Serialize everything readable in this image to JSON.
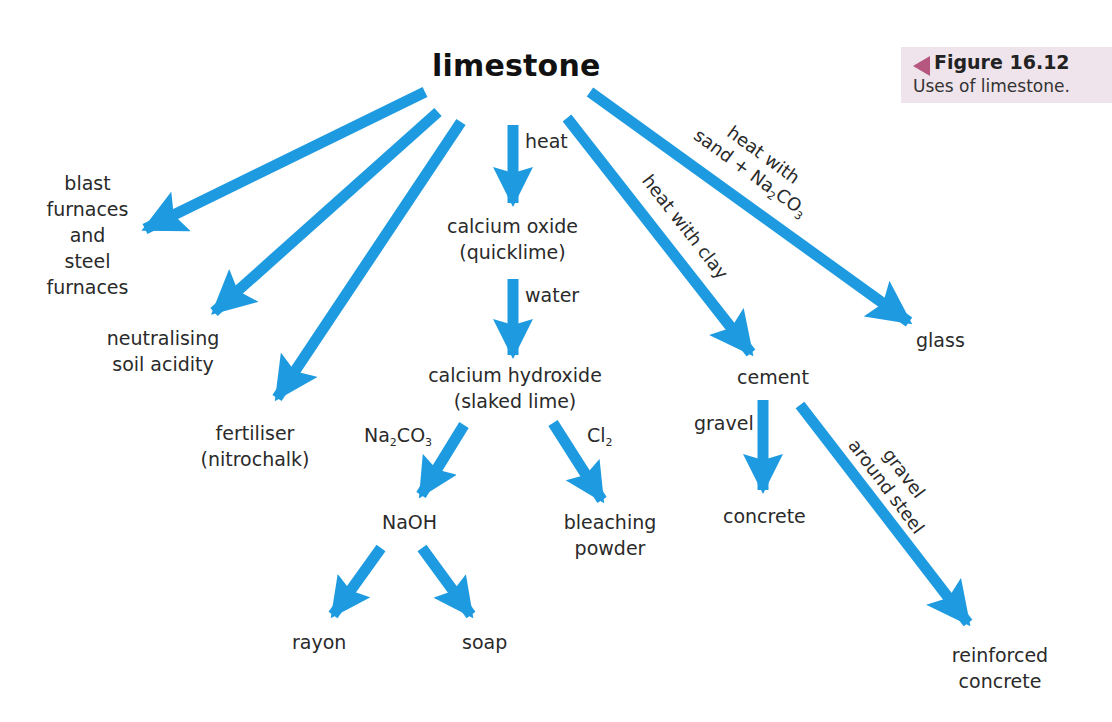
{
  "title": "limestone",
  "figure": {
    "number": "Figure 16.12",
    "caption": "Uses of limestone.",
    "marker_color": "#b5577f",
    "box_color": "#efe3ec"
  },
  "colors": {
    "arrow": "#1e9be0",
    "text": "#2a2a2a"
  },
  "nodes": {
    "blast_furnaces": [
      "blast",
      "furnaces",
      "and",
      "steel",
      "furnaces"
    ],
    "neutralising": [
      "neutralising",
      "soil acidity"
    ],
    "fertiliser": [
      "fertiliser",
      "(nitrochalk)"
    ],
    "calcium_oxide": [
      "calcium oxide",
      "(quicklime)"
    ],
    "calcium_hydroxide": [
      "calcium hydroxide",
      "(slaked lime)"
    ],
    "naoh": "NaOH",
    "bleaching_powder": [
      "bleaching",
      "powder"
    ],
    "rayon": "rayon",
    "soap": "soap",
    "cement": "cement",
    "concrete": "concrete",
    "reinforced_concrete": [
      "reinforced",
      "concrete"
    ],
    "glass": "glass"
  },
  "edge_labels": {
    "heat": "heat",
    "water": "water",
    "na2co3": {
      "a": "Na",
      "s1": "2",
      "b": "CO",
      "s2": "3"
    },
    "cl2": {
      "a": "Cl",
      "s1": "2"
    },
    "gravel": "gravel",
    "heat_with_clay": "heat with clay",
    "glass_line1": "heat with",
    "glass_line2": {
      "a": "sand + Na",
      "s1": "2",
      "b": "CO",
      "s2": "3"
    },
    "reinforced_line1": "gravel",
    "reinforced_line2": "around steel"
  },
  "edges": [
    {
      "from": "limestone",
      "to": "blast furnaces and steel furnaces",
      "label": ""
    },
    {
      "from": "limestone",
      "to": "neutralising soil acidity",
      "label": ""
    },
    {
      "from": "limestone",
      "to": "fertiliser (nitrochalk)",
      "label": ""
    },
    {
      "from": "limestone",
      "to": "calcium oxide (quicklime)",
      "label": "heat"
    },
    {
      "from": "calcium oxide (quicklime)",
      "to": "calcium hydroxide (slaked lime)",
      "label": "water"
    },
    {
      "from": "calcium hydroxide (slaked lime)",
      "to": "NaOH",
      "label": "Na2CO3"
    },
    {
      "from": "calcium hydroxide (slaked lime)",
      "to": "bleaching powder",
      "label": "Cl2"
    },
    {
      "from": "NaOH",
      "to": "rayon",
      "label": ""
    },
    {
      "from": "NaOH",
      "to": "soap",
      "label": ""
    },
    {
      "from": "limestone",
      "to": "cement",
      "label": "heat with clay"
    },
    {
      "from": "cement",
      "to": "concrete",
      "label": "gravel"
    },
    {
      "from": "cement",
      "to": "reinforced concrete",
      "label": "gravel around steel"
    },
    {
      "from": "limestone",
      "to": "glass",
      "label": "heat with sand + Na2CO3"
    }
  ]
}
